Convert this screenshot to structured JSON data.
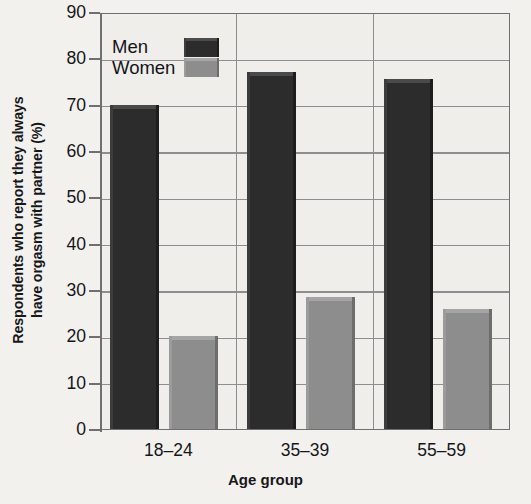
{
  "chart_data": {
    "type": "bar",
    "title": "",
    "xlabel": "Age group",
    "ylabel_line1": "Respondents who report they always",
    "ylabel_line2": "have orgasm with partner (%)",
    "ylabel": "Respondents who report they always have orgasm with partner (%)",
    "categories": [
      "18–24",
      "35–39",
      "55–59"
    ],
    "series": [
      {
        "name": "Men",
        "color": "#2c2c2c",
        "values": [
          70,
          77,
          75.5
        ]
      },
      {
        "name": "Women",
        "color": "#8d8d8d",
        "values": [
          20,
          28.5,
          26
        ]
      }
    ],
    "ylim": [
      0,
      90
    ],
    "ytick_values": [
      0,
      10,
      20,
      30,
      40,
      50,
      60,
      70,
      80,
      90
    ],
    "ytick_labels": [
      "0",
      "10",
      "20",
      "30",
      "40",
      "50",
      "60",
      "70",
      "80",
      "90"
    ],
    "grid": "horizontal-and-vertical-category-separators",
    "legend_position": "upper-left-inside",
    "legend_entries": [
      "Men",
      "Women"
    ],
    "plot_background": "#efeeea",
    "grid_color": "#8d8d90",
    "axis_color": "#6f6f72"
  }
}
